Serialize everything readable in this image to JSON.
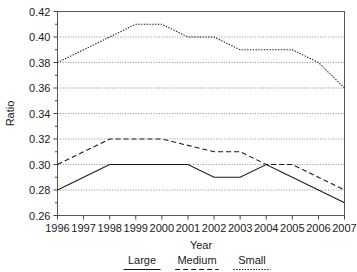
{
  "chart_data": {
    "type": "line",
    "title": "",
    "xlabel": "Year",
    "ylabel": "Ratio",
    "categories": [
      "1996",
      "1997",
      "1998",
      "1999",
      "2000",
      "2001",
      "2002",
      "2003",
      "2004",
      "2005",
      "2006",
      "2007"
    ],
    "x": [
      1996,
      1997,
      1998,
      1999,
      2000,
      2001,
      2002,
      2003,
      2004,
      2005,
      2006,
      2007
    ],
    "xlim": [
      1996,
      2007
    ],
    "ylim": [
      0.26,
      0.42
    ],
    "ytick_labels": [
      "0.26",
      "0.28",
      "0.30",
      "0.32",
      "0.34",
      "0.36",
      "0.38",
      "0.40",
      "0.42"
    ],
    "ytick_values": [
      0.26,
      0.28,
      0.3,
      0.32,
      0.34,
      0.36,
      0.38,
      0.4,
      0.42
    ],
    "grid": true,
    "legend_position": "bottom",
    "series": [
      {
        "name": "Large",
        "style": "solid",
        "color": "#1a1a1a",
        "values": [
          0.28,
          0.29,
          0.3,
          0.3,
          0.3,
          0.3,
          0.29,
          0.29,
          0.3,
          0.29,
          0.28,
          0.27
        ]
      },
      {
        "name": "Medium",
        "style": "dashed",
        "color": "#1a1a1a",
        "values": [
          0.3,
          0.31,
          0.32,
          0.32,
          0.32,
          0.315,
          0.31,
          0.31,
          0.3,
          0.3,
          0.29,
          0.28
        ]
      },
      {
        "name": "Small",
        "style": "dotted",
        "color": "#1a1a1a",
        "values": [
          0.38,
          0.39,
          0.4,
          0.41,
          0.41,
          0.4,
          0.4,
          0.39,
          0.39,
          0.39,
          0.38,
          0.36
        ]
      }
    ]
  },
  "legend": {
    "items": [
      {
        "label": "Large",
        "style": "solid"
      },
      {
        "label": "Medium",
        "style": "dashed"
      },
      {
        "label": "Small",
        "style": "dotted"
      }
    ]
  },
  "axes": {
    "x_title": "Year",
    "y_title": "Ratio"
  }
}
